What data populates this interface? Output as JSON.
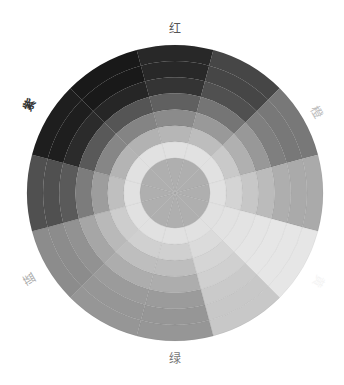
{
  "labels": {
    "red": "红",
    "orange": "橙",
    "yellow": "黄",
    "green": "绿",
    "blue": "蓝",
    "purple": "紫"
  },
  "wheel": {
    "center": [
      175,
      193
    ],
    "radius": 148,
    "sectors": 12,
    "rings": 8,
    "sector_base_gray": [
      40,
      70,
      120,
      170,
      230,
      200,
      150,
      150,
      140,
      80,
      30,
      25
    ]
  }
}
